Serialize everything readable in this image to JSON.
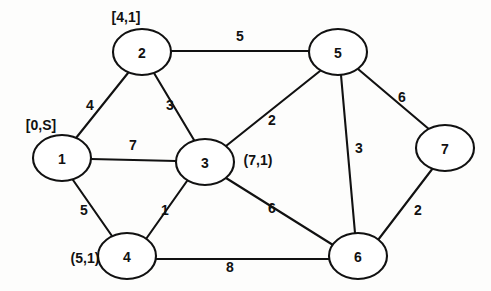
{
  "diagram": {
    "width": 491,
    "height": 291,
    "background_color": "#fdfdfc",
    "stroke_color": "#111111"
  },
  "nodes": [
    {
      "id": "1",
      "label": "1",
      "cx": 62,
      "cy": 158,
      "rx": 29,
      "ry": 23
    },
    {
      "id": "2",
      "label": "2",
      "cx": 142,
      "cy": 52,
      "rx": 29,
      "ry": 23
    },
    {
      "id": "3",
      "label": "3",
      "cx": 205,
      "cy": 162,
      "rx": 29,
      "ry": 23
    },
    {
      "id": "4",
      "label": "4",
      "cx": 127,
      "cy": 256,
      "rx": 29,
      "ry": 23
    },
    {
      "id": "5",
      "label": "5",
      "cx": 338,
      "cy": 52,
      "rx": 29,
      "ry": 23
    },
    {
      "id": "6",
      "label": "6",
      "cx": 358,
      "cy": 256,
      "rx": 29,
      "ry": 23
    },
    {
      "id": "7",
      "label": "7",
      "cx": 445,
      "cy": 148,
      "rx": 29,
      "ry": 23
    }
  ],
  "edges": [
    {
      "id": "e-1-2",
      "from": "1",
      "to": "2",
      "weight": "4",
      "x1": 76,
      "y1": 138,
      "x2": 128,
      "y2": 73,
      "label_x": 90,
      "label_y": 105
    },
    {
      "id": "e-2-3",
      "from": "2",
      "to": "3",
      "weight": "3",
      "x1": 154,
      "y1": 73,
      "x2": 194,
      "y2": 140,
      "label_x": 170,
      "label_y": 105
    },
    {
      "id": "e-2-5",
      "from": "2",
      "to": "5",
      "weight": "5",
      "x1": 171,
      "y1": 51,
      "x2": 309,
      "y2": 51,
      "label_x": 240,
      "label_y": 36
    },
    {
      "id": "e-1-3",
      "from": "1",
      "to": "3",
      "weight": "7",
      "x1": 91,
      "y1": 159,
      "x2": 176,
      "y2": 161,
      "label_x": 133,
      "label_y": 145
    },
    {
      "id": "e-1-4",
      "from": "1",
      "to": "4",
      "weight": "5",
      "x1": 73,
      "y1": 180,
      "x2": 112,
      "y2": 236,
      "label_x": 84,
      "label_y": 210
    },
    {
      "id": "e-3-4",
      "from": "3",
      "to": "4",
      "weight": "1",
      "x1": 187,
      "y1": 181,
      "x2": 146,
      "y2": 239,
      "label_x": 165,
      "label_y": 210
    },
    {
      "id": "e-3-5",
      "from": "3",
      "to": "5",
      "weight": "2",
      "x1": 226,
      "y1": 146,
      "x2": 320,
      "y2": 71,
      "label_x": 272,
      "label_y": 120
    },
    {
      "id": "e-3-6",
      "from": "3",
      "to": "6",
      "weight": "6",
      "x1": 226,
      "y1": 178,
      "x2": 333,
      "y2": 245,
      "label_x": 272,
      "label_y": 208
    },
    {
      "id": "e-5-7",
      "from": "5",
      "to": "7",
      "weight": "6",
      "x1": 358,
      "y1": 69,
      "x2": 430,
      "y2": 130,
      "label_x": 402,
      "label_y": 97
    },
    {
      "id": "e-5-6",
      "from": "5",
      "to": "6",
      "weight": "3",
      "x1": 341,
      "y1": 75,
      "x2": 355,
      "y2": 233,
      "label_x": 359,
      "label_y": 148
    },
    {
      "id": "e-6-7",
      "from": "6",
      "to": "7",
      "weight": "2",
      "x1": 378,
      "y1": 240,
      "x2": 433,
      "y2": 168,
      "label_x": 418,
      "label_y": 210
    },
    {
      "id": "e-4-6",
      "from": "4",
      "to": "6",
      "weight": "8",
      "x1": 156,
      "y1": 259,
      "x2": 329,
      "y2": 259,
      "label_x": 230,
      "label_y": 267
    }
  ],
  "annotations": [
    {
      "id": "annot-node-1",
      "node": "1",
      "text": "[0,S]",
      "x": 41,
      "y": 125
    },
    {
      "id": "annot-node-2",
      "node": "2",
      "text": "[4,1]",
      "x": 126,
      "y": 17
    },
    {
      "id": "annot-node-3",
      "node": "3",
      "text": "(7,1)",
      "x": 258,
      "y": 160
    },
    {
      "id": "annot-node-4",
      "node": "4",
      "text": "(5,1)",
      "x": 85,
      "y": 258
    }
  ]
}
